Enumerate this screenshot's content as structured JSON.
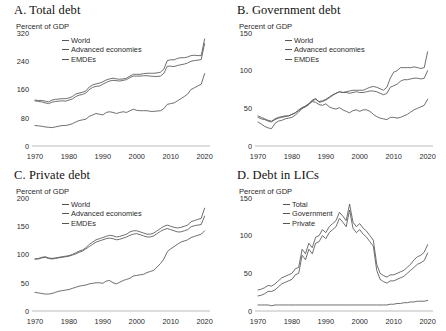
{
  "figure": {
    "background": "#ffffff",
    "line_color": "#555555",
    "axis_color": "#bbbbbb"
  },
  "panels": [
    {
      "id": "A",
      "title": "A. Total debt",
      "subtitle": "Percent of GDP",
      "legend": [
        "World",
        "Advanced economies",
        "EMDEs"
      ]
    },
    {
      "id": "B",
      "title": "B. Government debt",
      "subtitle": "Percent of GDP",
      "legend": [
        "World",
        "Advanced economies",
        "EMDEs"
      ]
    },
    {
      "id": "C",
      "title": "C. Private debt",
      "subtitle": "Percent of GDP",
      "legend": [
        "World",
        "Advanced economies",
        "EMDEs"
      ]
    },
    {
      "id": "D",
      "title": "D. Debt in LICs",
      "subtitle": "Percent of GDP",
      "legend": [
        "Total",
        "Government",
        "Private"
      ]
    }
  ],
  "chart_data": [
    {
      "type": "line",
      "title": "A. Total debt",
      "xlabel": "",
      "ylabel": "Percent of GDP",
      "xlim": [
        1970,
        2021
      ],
      "ylim": [
        0,
        320
      ],
      "yticks": [
        0,
        80,
        160,
        240,
        320
      ],
      "xticks": [
        1970,
        1980,
        1990,
        2000,
        2010,
        2020
      ],
      "grid": false,
      "legend_position": "top-left",
      "x": [
        1970,
        1971,
        1972,
        1973,
        1974,
        1975,
        1976,
        1977,
        1978,
        1979,
        1980,
        1981,
        1982,
        1983,
        1984,
        1985,
        1986,
        1987,
        1988,
        1989,
        1990,
        1991,
        1992,
        1993,
        1994,
        1995,
        1996,
        1997,
        1998,
        1999,
        2000,
        2001,
        2002,
        2003,
        2004,
        2005,
        2006,
        2007,
        2008,
        2009,
        2010,
        2011,
        2012,
        2013,
        2014,
        2015,
        2016,
        2017,
        2018,
        2019,
        2020
      ],
      "series": [
        {
          "name": "World",
          "values": [
            128,
            126,
            125,
            122,
            120,
            124,
            126,
            127,
            128,
            127,
            130,
            133,
            140,
            144,
            146,
            150,
            160,
            166,
            169,
            170,
            175,
            180,
            184,
            186,
            185,
            184,
            186,
            188,
            194,
            198,
            198,
            198,
            199,
            199,
            198,
            197,
            197,
            198,
            206,
            226,
            226,
            225,
            228,
            230,
            232,
            235,
            240,
            242,
            243,
            245,
            290
          ]
        },
        {
          "name": "Advanced economies",
          "values": [
            130,
            129,
            129,
            127,
            125,
            130,
            132,
            133,
            134,
            134,
            136,
            140,
            147,
            150,
            152,
            156,
            167,
            173,
            176,
            178,
            182,
            187,
            190,
            192,
            190,
            189,
            190,
            192,
            198,
            203,
            203,
            203,
            205,
            206,
            206,
            206,
            207,
            209,
            218,
            242,
            244,
            244,
            248,
            250,
            250,
            252,
            256,
            257,
            256,
            256,
            303
          ]
        },
        {
          "name": "EMDEs",
          "values": [
            58,
            57,
            56,
            54,
            53,
            52,
            54,
            56,
            58,
            58,
            60,
            63,
            68,
            72,
            74,
            76,
            84,
            88,
            92,
            90,
            88,
            95,
            97,
            95,
            92,
            95,
            97,
            95,
            100,
            104,
            101,
            100,
            100,
            100,
            98,
            98,
            99,
            100,
            106,
            118,
            120,
            122,
            128,
            134,
            140,
            147,
            160,
            165,
            170,
            175,
            205
          ]
        }
      ]
    },
    {
      "type": "line",
      "title": "B. Government debt",
      "xlabel": "",
      "ylabel": "Percent of GDP",
      "xlim": [
        1970,
        2021
      ],
      "ylim": [
        0,
        150
      ],
      "yticks": [
        0,
        50,
        100,
        150
      ],
      "xticks": [
        1970,
        1980,
        1990,
        2000,
        2010,
        2020
      ],
      "grid": false,
      "legend_position": "top-left",
      "x": [
        1970,
        1971,
        1972,
        1973,
        1974,
        1975,
        1976,
        1977,
        1978,
        1979,
        1980,
        1981,
        1982,
        1983,
        1984,
        1985,
        1986,
        1987,
        1988,
        1989,
        1990,
        1991,
        1992,
        1993,
        1994,
        1995,
        1996,
        1997,
        1998,
        1999,
        2000,
        2001,
        2002,
        2003,
        2004,
        2005,
        2006,
        2007,
        2008,
        2009,
        2010,
        2011,
        2012,
        2013,
        2014,
        2015,
        2016,
        2017,
        2018,
        2019,
        2020
      ],
      "series": [
        {
          "name": "World",
          "values": [
            40,
            38,
            36,
            34,
            33,
            36,
            38,
            39,
            40,
            40,
            42,
            44,
            47,
            50,
            52,
            55,
            60,
            62,
            59,
            60,
            62,
            65,
            68,
            70,
            72,
            71,
            71,
            70,
            71,
            72,
            71,
            71,
            72,
            73,
            73,
            72,
            70,
            68,
            70,
            78,
            80,
            82,
            86,
            88,
            88,
            89,
            90,
            90,
            89,
            90,
            100
          ]
        },
        {
          "name": "Advanced economies",
          "values": [
            38,
            36,
            35,
            33,
            32,
            35,
            37,
            38,
            39,
            40,
            42,
            44,
            48,
            51,
            53,
            56,
            61,
            63,
            58,
            59,
            61,
            64,
            67,
            70,
            72,
            71,
            72,
            73,
            74,
            74,
            74,
            74,
            76,
            78,
            79,
            78,
            76,
            74,
            78,
            90,
            98,
            100,
            104,
            104,
            104,
            104,
            105,
            104,
            103,
            104,
            125
          ]
        },
        {
          "name": "EMDEs",
          "values": [
            32,
            29,
            26,
            24,
            23,
            30,
            33,
            34,
            36,
            37,
            38,
            41,
            45,
            50,
            53,
            56,
            59,
            58,
            55,
            54,
            56,
            52,
            50,
            49,
            51,
            48,
            46,
            44,
            47,
            48,
            46,
            48,
            48,
            46,
            42,
            39,
            37,
            36,
            35,
            38,
            38,
            37,
            38,
            40,
            42,
            45,
            48,
            50,
            52,
            54,
            62
          ]
        }
      ]
    },
    {
      "type": "line",
      "title": "C. Private debt",
      "xlabel": "",
      "ylabel": "Percent of GDP",
      "xlim": [
        1970,
        2021
      ],
      "ylim": [
        0,
        200
      ],
      "yticks": [
        0,
        50,
        100,
        150,
        200
      ],
      "xticks": [
        1970,
        1980,
        1990,
        2000,
        2010,
        2020
      ],
      "grid": false,
      "legend_position": "top-left",
      "x": [
        1970,
        1971,
        1972,
        1973,
        1974,
        1975,
        1976,
        1977,
        1978,
        1979,
        1980,
        1981,
        1982,
        1983,
        1984,
        1985,
        1986,
        1987,
        1988,
        1989,
        1990,
        1991,
        1992,
        1993,
        1994,
        1995,
        1996,
        1997,
        1998,
        1999,
        2000,
        2001,
        2002,
        2003,
        2004,
        2005,
        2006,
        2007,
        2008,
        2009,
        2010,
        2011,
        2012,
        2013,
        2014,
        2015,
        2016,
        2017,
        2018,
        2019,
        2020
      ],
      "series": [
        {
          "name": "World",
          "values": [
            92,
            93,
            95,
            96,
            94,
            93,
            94,
            95,
            96,
            97,
            98,
            100,
            103,
            106,
            108,
            112,
            118,
            122,
            126,
            128,
            130,
            132,
            134,
            133,
            131,
            132,
            134,
            136,
            140,
            142,
            142,
            140,
            138,
            136,
            136,
            138,
            142,
            146,
            150,
            152,
            150,
            148,
            147,
            148,
            150,
            152,
            158,
            160,
            162,
            164,
            182
          ]
        },
        {
          "name": "Advanced economies",
          "values": [
            92,
            92,
            94,
            95,
            93,
            92,
            93,
            94,
            95,
            96,
            97,
            99,
            101,
            104,
            106,
            110,
            114,
            118,
            122,
            124,
            126,
            128,
            129,
            128,
            126,
            127,
            129,
            131,
            134,
            136,
            137,
            135,
            133,
            131,
            131,
            133,
            137,
            141,
            144,
            146,
            144,
            142,
            140,
            140,
            142,
            144,
            149,
            151,
            152,
            153,
            168
          ]
        },
        {
          "name": "EMDEs",
          "values": [
            33,
            32,
            31,
            30,
            30,
            31,
            33,
            35,
            36,
            37,
            38,
            40,
            42,
            44,
            45,
            46,
            48,
            49,
            50,
            50,
            49,
            53,
            54,
            50,
            48,
            51,
            54,
            56,
            58,
            62,
            63,
            64,
            65,
            68,
            70,
            72,
            78,
            84,
            92,
            105,
            110,
            114,
            118,
            122,
            124,
            126,
            130,
            132,
            134,
            136,
            142
          ]
        }
      ]
    },
    {
      "type": "line",
      "title": "D. Debt in LICs",
      "xlabel": "",
      "ylabel": "Percent of GDP",
      "xlim": [
        1970,
        2021
      ],
      "ylim": [
        0,
        150
      ],
      "yticks": [
        0,
        50,
        100,
        150
      ],
      "xticks": [
        1970,
        1980,
        1990,
        2000,
        2010,
        2020
      ],
      "grid": false,
      "legend_position": "top-left",
      "x": [
        1970,
        1971,
        1972,
        1973,
        1974,
        1975,
        1976,
        1977,
        1978,
        1979,
        1980,
        1981,
        1982,
        1983,
        1984,
        1985,
        1986,
        1987,
        1988,
        1989,
        1990,
        1991,
        1992,
        1993,
        1994,
        1995,
        1996,
        1997,
        1998,
        1999,
        2000,
        2001,
        2002,
        2003,
        2004,
        2005,
        2006,
        2007,
        2008,
        2009,
        2010,
        2011,
        2012,
        2013,
        2014,
        2015,
        2016,
        2017,
        2018,
        2019,
        2020
      ],
      "series": [
        {
          "name": "Total",
          "values": [
            28,
            29,
            31,
            34,
            33,
            36,
            40,
            44,
            46,
            48,
            50,
            56,
            58,
            82,
            76,
            90,
            84,
            98,
            100,
            108,
            104,
            112,
            116,
            120,
            131,
            126,
            120,
            142,
            118,
            112,
            116,
            110,
            106,
            100,
            94,
            62,
            50,
            47,
            45,
            48,
            48,
            50,
            52,
            54,
            58,
            62,
            68,
            72,
            74,
            78,
            88
          ]
        },
        {
          "name": "Government",
          "values": [
            20,
            21,
            23,
            26,
            26,
            28,
            32,
            36,
            38,
            40,
            42,
            48,
            50,
            74,
            68,
            82,
            76,
            90,
            92,
            100,
            96,
            104,
            108,
            112,
            123,
            118,
            112,
            134,
            110,
            104,
            108,
            102,
            98,
            92,
            86,
            54,
            42,
            39,
            37,
            40,
            40,
            42,
            44,
            46,
            50,
            54,
            58,
            62,
            64,
            67,
            77
          ]
        },
        {
          "name": "Private",
          "values": [
            8,
            8,
            8,
            8,
            7,
            8,
            8,
            8,
            8,
            8,
            8,
            8,
            8,
            8,
            8,
            8,
            8,
            8,
            8,
            8,
            8,
            8,
            8,
            8,
            8,
            8,
            8,
            8,
            8,
            8,
            8,
            8,
            8,
            8,
            8,
            8,
            8,
            8,
            8,
            9,
            9,
            10,
            10,
            11,
            11,
            12,
            12,
            13,
            13,
            13,
            14
          ]
        }
      ]
    }
  ]
}
